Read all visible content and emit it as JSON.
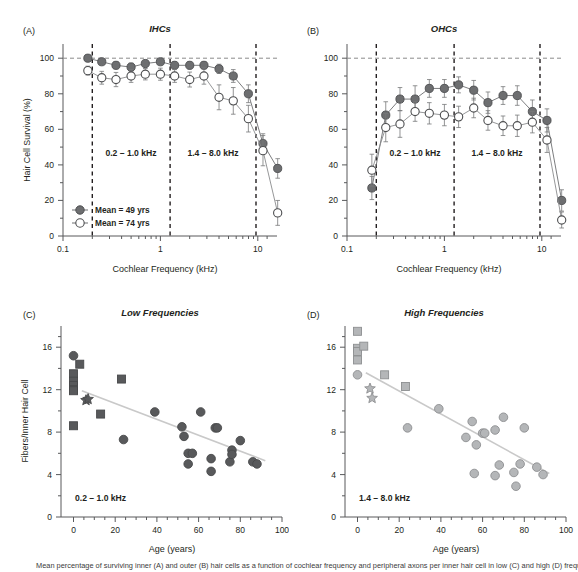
{
  "figure": {
    "caption": "Mean percentage of surviving inner (A) and outer (B) hair cells as a function of cochlear frequency and peripheral axons per inner hair cell in low (C) and high (D) frequency regions."
  },
  "panels": {
    "a": {
      "letter": "(A)",
      "title": "IHCs",
      "xlabel": "Cochlear Frequency (kHz)",
      "ylabel": "Hair Cell Survival (%)",
      "xticks": [
        "0.1",
        "1",
        "10"
      ],
      "yticks": [
        "0",
        "20",
        "40",
        "60",
        "80",
        "100"
      ],
      "annotations": [
        "0.2 – 1.0 kHz",
        "1.4 – 8.0 kHz"
      ],
      "legend": [
        {
          "label": "Mean = 49 yrs",
          "marker": "filled-circle"
        },
        {
          "label": "Mean = 74 yrs",
          "marker": "open-circle"
        }
      ]
    },
    "b": {
      "letter": "(B)",
      "title": "OHCs",
      "xlabel": "Cochlear Frequency (kHz)",
      "ylabel": "",
      "xticks": [
        "0.1",
        "1",
        "10"
      ],
      "yticks": [
        "0",
        "20",
        "40",
        "60",
        "80",
        "100"
      ],
      "annotations": [
        "0.2 – 1.0 kHz",
        "1.4 – 8.0 kHz"
      ]
    },
    "c": {
      "letter": "(C)",
      "title": "Low Frequencies",
      "xlabel": "Age (years)",
      "ylabel": "Fibers/Inner Hair Cell",
      "xticks": [
        "0",
        "20",
        "40",
        "60",
        "80",
        "100"
      ],
      "yticks": [
        "0",
        "4",
        "8",
        "12",
        "16"
      ],
      "annotations": [
        "0.2 – 1.0 kHz"
      ]
    },
    "d": {
      "letter": "(D)",
      "title": "High Frequencies",
      "xlabel": "Age (years)",
      "ylabel": "",
      "xticks": [
        "0",
        "20",
        "40",
        "60",
        "80",
        "100"
      ],
      "yticks": [
        "0",
        "4",
        "8",
        "12",
        "16"
      ],
      "annotations": [
        "1.4 – 8.0 kHz"
      ]
    }
  },
  "colors": {
    "filled_marker": "#6d6e70",
    "open_marker": "#ffffff",
    "marker_stroke": "#58595b",
    "light_marker": "#a7a9ac",
    "axis": "#58595b",
    "text": "#231f20",
    "gridline": "#9a9a9a",
    "trendline": "#c9c9c9"
  },
  "chart_data": [
    {
      "id": "panel-a",
      "type": "line",
      "title": "IHCs",
      "xlabel": "Cochlear Frequency (kHz)",
      "ylabel": "Hair Cell Survival (%)",
      "xscale": "log",
      "xlim": [
        0.1,
        22
      ],
      "ylim": [
        0,
        108
      ],
      "grid": false,
      "hline": 100,
      "vlines": [
        0.2,
        1.2,
        9.5
      ],
      "legend_position": "lower-left",
      "series": [
        {
          "name": "Mean = 49 yrs",
          "marker": "filled-circle",
          "x": [
            0.18,
            0.25,
            0.35,
            0.5,
            0.7,
            1.0,
            1.4,
            2.0,
            2.8,
            4.0,
            5.6,
            8.0,
            11.3,
            16.0
          ],
          "y": [
            100,
            98,
            96,
            95,
            97,
            98,
            96,
            96,
            96,
            94,
            90,
            80,
            52,
            38
          ],
          "yerr": [
            1.2,
            1.6,
            2.0,
            2.3,
            1.8,
            1.6,
            2.0,
            2.0,
            2.0,
            2.6,
            3.6,
            5.0,
            5.5,
            5.5
          ]
        },
        {
          "name": "Mean = 74 yrs",
          "marker": "open-circle",
          "x": [
            0.18,
            0.25,
            0.35,
            0.5,
            0.7,
            1.0,
            1.4,
            2.0,
            2.8,
            4.0,
            5.6,
            8.0,
            11.3,
            16.0
          ],
          "y": [
            93,
            89,
            88,
            90,
            91,
            91,
            90,
            88,
            90,
            78,
            76,
            66,
            48,
            13
          ],
          "yerr": [
            2.5,
            3.6,
            4.0,
            3.6,
            3.2,
            3.4,
            3.6,
            4.2,
            4.6,
            7.0,
            7.5,
            7.5,
            8.5,
            7.0
          ]
        }
      ]
    },
    {
      "id": "panel-b",
      "type": "line",
      "title": "OHCs",
      "xlabel": "Cochlear Frequency (kHz)",
      "ylabel": "Hair Cell Survival (%)",
      "xscale": "log",
      "xlim": [
        0.1,
        22
      ],
      "ylim": [
        0,
        108
      ],
      "grid": false,
      "hline": 100,
      "vlines": [
        0.2,
        1.2,
        9.5
      ],
      "series": [
        {
          "name": "Mean = 49 yrs",
          "marker": "filled-circle",
          "x": [
            0.18,
            0.25,
            0.35,
            0.5,
            0.7,
            1.0,
            1.4,
            2.0,
            2.8,
            4.0,
            5.6,
            8.0,
            11.3,
            16.0
          ],
          "y": [
            27,
            68,
            77,
            77,
            83,
            83,
            85,
            82,
            75,
            79,
            79,
            70,
            65,
            20
          ],
          "yerr": [
            6.5,
            7.5,
            6.5,
            7.5,
            5.0,
            5.0,
            4.5,
            5.5,
            6.0,
            5.0,
            5.5,
            6.5,
            6.5,
            6.0
          ]
        },
        {
          "name": "Mean = 74 yrs",
          "marker": "open-circle",
          "x": [
            0.18,
            0.25,
            0.35,
            0.5,
            0.7,
            1.0,
            1.4,
            2.0,
            2.8,
            4.0,
            5.6,
            8.0,
            11.3,
            16.0
          ],
          "y": [
            37,
            61,
            63,
            70,
            69,
            68,
            67,
            72,
            65,
            62,
            62,
            64,
            54,
            9
          ],
          "yerr": [
            9.0,
            8.0,
            7.5,
            5.5,
            6.0,
            6.0,
            6.0,
            5.5,
            5.5,
            5.5,
            6.0,
            6.0,
            7.0,
            4.5
          ]
        }
      ]
    },
    {
      "id": "panel-c",
      "type": "scatter",
      "title": "Low Frequencies",
      "xlabel": "Age (years)",
      "ylabel": "Fibers/Inner Hair Cell",
      "xlim": [
        -6,
        100
      ],
      "ylim": [
        0,
        18
      ],
      "grid": false,
      "annotation": "0.2 – 1.0 kHz",
      "trendline": {
        "x": [
          4,
          92
        ],
        "y": [
          11.9,
          5.3
        ]
      },
      "series": [
        {
          "name": "squares",
          "marker": "square",
          "points": [
            [
              0,
              13.5
            ],
            [
              0,
              12.8
            ],
            [
              0,
              12.4
            ],
            [
              0,
              12.0
            ],
            [
              0,
              11.9
            ],
            [
              0,
              8.6
            ],
            [
              3,
              14.4
            ],
            [
              13,
              9.7
            ],
            [
              23,
              13.0
            ]
          ]
        },
        {
          "name": "stars",
          "marker": "star",
          "points": [
            [
              6,
              11.0
            ],
            [
              7,
              11.1
            ]
          ]
        },
        {
          "name": "circles",
          "marker": "circle",
          "points": [
            [
              0,
              15.2
            ],
            [
              24,
              7.3
            ],
            [
              39,
              9.9
            ],
            [
              52,
              8.5
            ],
            [
              53,
              7.6
            ],
            [
              55,
              6.0
            ],
            [
              55,
              5.0
            ],
            [
              57,
              6.0
            ],
            [
              61,
              9.9
            ],
            [
              66,
              4.3
            ],
            [
              66,
              5.5
            ],
            [
              68,
              8.4
            ],
            [
              69,
              8.4
            ],
            [
              75,
              5.2
            ],
            [
              76,
              6.3
            ],
            [
              76,
              5.9
            ],
            [
              80,
              7.2
            ],
            [
              86,
              5.2
            ],
            [
              88,
              5.0
            ]
          ]
        }
      ]
    },
    {
      "id": "panel-d",
      "type": "scatter",
      "title": "High Frequencies",
      "xlabel": "Age (years)",
      "ylabel": "Fibers/Inner Hair Cell",
      "xlim": [
        -6,
        100
      ],
      "ylim": [
        0,
        18
      ],
      "grid": false,
      "annotation": "1.4 – 8.0 kHz",
      "trendline": {
        "x": [
          4,
          92
        ],
        "y": [
          13.6,
          4.1
        ]
      },
      "series": [
        {
          "name": "squares",
          "marker": "square",
          "points": [
            [
              0,
              17.5
            ],
            [
              0,
              15.9
            ],
            [
              0,
              15.6
            ],
            [
              0,
              14.8
            ],
            [
              3,
              16.1
            ],
            [
              13,
              13.4
            ],
            [
              23,
              12.3
            ]
          ]
        },
        {
          "name": "stars",
          "marker": "star",
          "points": [
            [
              6,
              12.1
            ],
            [
              7,
              11.2
            ]
          ]
        },
        {
          "name": "circles",
          "marker": "circle",
          "points": [
            [
              0,
              13.4
            ],
            [
              24,
              8.4
            ],
            [
              39,
              10.2
            ],
            [
              52,
              7.5
            ],
            [
              55,
              9.0
            ],
            [
              56,
              4.1
            ],
            [
              57,
              6.8
            ],
            [
              60,
              7.9
            ],
            [
              61,
              7.9
            ],
            [
              66,
              8.2
            ],
            [
              66,
              3.9
            ],
            [
              68,
              4.9
            ],
            [
              70,
              9.4
            ],
            [
              75,
              4.2
            ],
            [
              76,
              2.9
            ],
            [
              78,
              5.0
            ],
            [
              80,
              8.4
            ],
            [
              86,
              4.7
            ],
            [
              89,
              4.0
            ]
          ]
        }
      ]
    }
  ]
}
